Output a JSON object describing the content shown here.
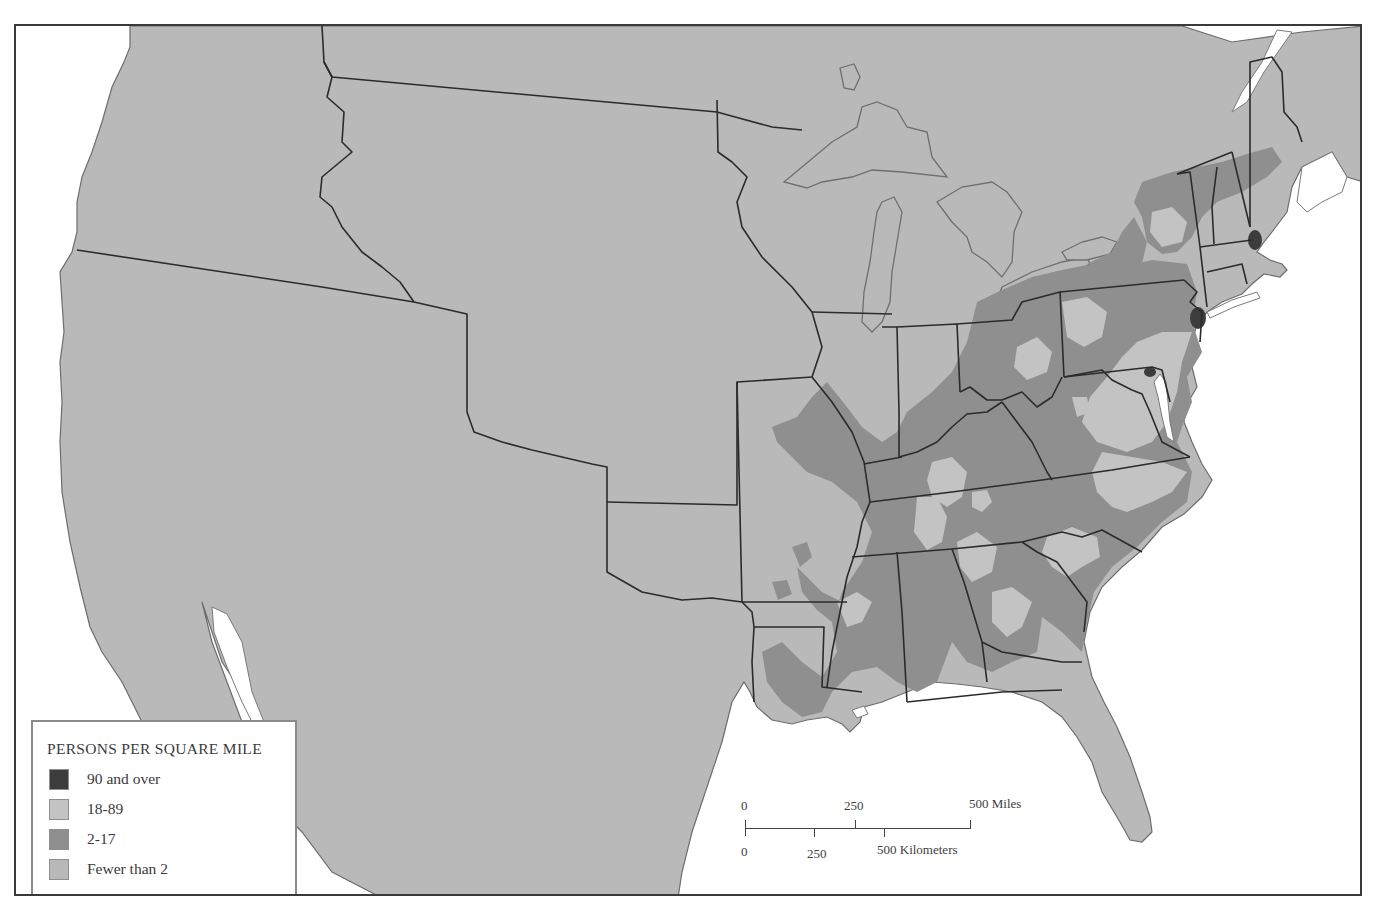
{
  "map": {
    "type": "choropleth",
    "subject": "Population density of the United States",
    "colors": {
      "dense": "#3c3c3c",
      "light": "#c3c3c3",
      "mid": "#8f8f8f",
      "low": "#b9b9b9",
      "water": "#ffffff",
      "border": "#2b2b2b"
    }
  },
  "legend": {
    "title": "PERSONS PER SQUARE MILE",
    "items": [
      {
        "label": "90 and over",
        "color": "#3c3c3c"
      },
      {
        "label": "18-89",
        "color": "#c3c3c3"
      },
      {
        "label": "2-17",
        "color": "#8f8f8f"
      },
      {
        "label": "Fewer than 2",
        "color": "#b9b9b9"
      }
    ]
  },
  "scale_bar": {
    "miles": {
      "ticks": [
        "0",
        "250",
        "500 Miles"
      ]
    },
    "kilometers": {
      "ticks": [
        "0",
        "250",
        "500 Kilometers"
      ]
    }
  }
}
